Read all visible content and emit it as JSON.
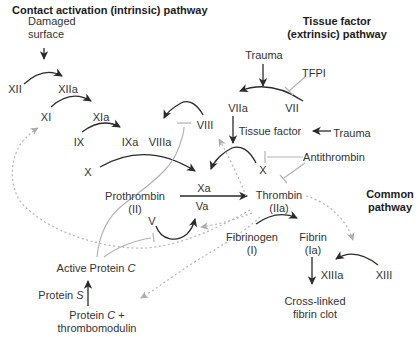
{
  "titles": {
    "intrinsic": "Contact activation (intrinsic) pathway",
    "extrinsic_line1": "Tissue factor",
    "extrinsic_line2": "(extrinsic) pathway",
    "common_line1": "Common",
    "common_line2": "pathway"
  },
  "nodes": {
    "damaged_surface_line1": "Damaged",
    "damaged_surface_line2": "surface",
    "xii": "XII",
    "xiia": "XIIa",
    "xi": "XI",
    "xia": "XIa",
    "ix": "IX",
    "ixa": "IXa",
    "viiia": "VIIIa",
    "viii": "VIII",
    "x_left": "X",
    "x_right": "X",
    "prothrombin_line1": "Prothrombin",
    "prothrombin_line2": "(II)",
    "xa": "Xa",
    "va": "Va",
    "v": "V",
    "thrombin_line1": "Thrombin",
    "thrombin_line2": "(IIa)",
    "fibrinogen_line1": "Fibrinogen",
    "fibrinogen_line2": "(I)",
    "fibrin_line1": "Fibrin",
    "fibrin_line2": "(Ia)",
    "xiiia": "XIIIa",
    "xiii": "XIII",
    "crosslinked_line1": "Cross-linked",
    "crosslinked_line2": "fibrin clot",
    "trauma_top": "Trauma",
    "trauma_right": "Trauma",
    "tfpi": "TFPI",
    "viia": "VIIa",
    "vii": "VII",
    "tissue_factor": "Tissue factor",
    "antithrombin": "Antithrombin",
    "active_protein_c": {
      "pre": "Active Protein ",
      "it": "C"
    },
    "protein_s": {
      "pre": "Protein ",
      "it": "S"
    },
    "protein_c_tm_line1": {
      "pre": "Protein ",
      "it": "C",
      "post": " +"
    },
    "protein_c_tm_line2": "thrombomodulin"
  },
  "colors": {
    "background": "#ffffff",
    "text": "#333333",
    "activation_arrow": "#2b2b2b",
    "inhibition_line": "#b3b3b3",
    "feedback_dotted": "#b5b5b5"
  }
}
